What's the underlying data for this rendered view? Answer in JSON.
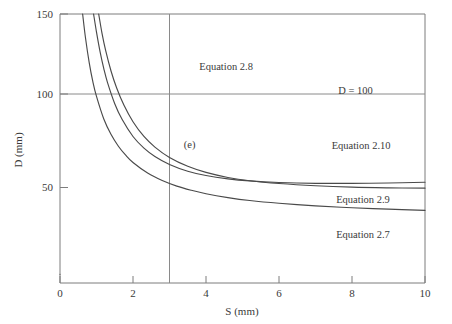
{
  "chart_data": {
    "type": "line",
    "title": "",
    "xlabel": "S (mm)",
    "ylabel": "D (mm)",
    "xlim": [
      0,
      10
    ],
    "ylim": [
      0,
      150
    ],
    "xticks": [
      0,
      2,
      4,
      6,
      8,
      10
    ],
    "yticks": [
      50,
      100,
      150
    ],
    "xtick_labels": [
      "0",
      "2",
      "4",
      "6",
      "8",
      "10"
    ],
    "ytick_labels": [
      "50",
      "100",
      "150"
    ],
    "grid": false,
    "legend": "none",
    "reference_lines": [
      {
        "name": "D = 100",
        "orientation": "horizontal",
        "value": 100,
        "label": "D = 100"
      },
      {
        "name": "S = 3",
        "orientation": "vertical",
        "value": 3,
        "label": ""
      }
    ],
    "annotations": [
      {
        "text": "Equation 2.8",
        "x": 4.55,
        "y": 118
      },
      {
        "text": "D = 100",
        "x": 8.1,
        "y": 104
      },
      {
        "text": "(e)",
        "x": 3.55,
        "y": 73
      },
      {
        "text": "Equation 2.10",
        "x": 8.25,
        "y": 72
      },
      {
        "text": "Equation 2.9",
        "x": 8.3,
        "y": 41
      },
      {
        "text": "Equation 2.7",
        "x": 8.3,
        "y": 21
      }
    ],
    "series": [
      {
        "name": "Equation 2.8",
        "x": [
          0.62,
          0.7,
          0.8,
          0.9,
          1.0,
          1.2,
          1.4,
          1.6,
          1.8,
          2.0,
          2.4,
          2.8,
          3.2,
          3.6,
          4.0,
          4.6,
          5.2,
          6.0,
          7.0,
          8.0,
          9.0,
          10.0
        ],
        "y": [
          150.0,
          136.0,
          122.0,
          111.0,
          102.5,
          89.5,
          80.5,
          73.8,
          68.6,
          64.4,
          58.3,
          54.0,
          50.8,
          48.4,
          46.4,
          44.2,
          42.5,
          40.9,
          39.4,
          38.3,
          37.5,
          36.8
        ]
      },
      {
        "name": "Equation 2.10",
        "x": [
          0.92,
          1.0,
          1.1,
          1.2,
          1.3,
          1.5,
          1.7,
          2.0,
          2.3,
          2.6,
          3.0,
          3.5,
          4.0,
          4.6,
          5.2,
          6.0,
          7.0,
          8.0,
          9.0,
          10.0
        ],
        "y": [
          150.0,
          139.5,
          128.0,
          118.5,
          110.6,
          98.3,
          89.3,
          79.4,
          72.7,
          67.9,
          63.3,
          59.4,
          56.9,
          55.0,
          53.8,
          52.9,
          52.4,
          52.4,
          52.6,
          53.0
        ]
      },
      {
        "name": "Equation 2.9",
        "x": [
          1.06,
          1.15,
          1.25,
          1.4,
          1.55,
          1.75,
          2.0,
          2.3,
          2.6,
          3.0,
          3.5,
          4.0,
          4.6,
          5.2,
          6.0,
          7.0,
          8.0,
          9.0,
          10.0
        ],
        "y": [
          150.0,
          139.0,
          129.0,
          117.0,
          107.5,
          97.5,
          87.9,
          79.4,
          73.3,
          67.3,
          62.2,
          58.7,
          55.8,
          53.9,
          52.3,
          51.0,
          50.2,
          49.8,
          49.6
        ]
      },
      {
        "name": "Equation 2.7",
        "x": [
          0.0,
          0.0,
          0.0
        ],
        "y": [
          0,
          0,
          0
        ]
      }
    ]
  },
  "axis": {
    "x_title": "S (mm)",
    "y_title": "D (mm)"
  }
}
